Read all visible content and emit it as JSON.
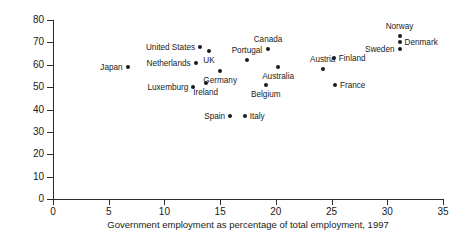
{
  "chart_data": {
    "type": "scatter",
    "title": "",
    "xlabel": "Government employment as percentage of total employment, 1997",
    "ylabel": "Women's rates of employment, 1998 (%)",
    "xlim": [
      0,
      35
    ],
    "ylim": [
      0,
      80
    ],
    "xticks": [
      "0",
      "5",
      "10",
      "15",
      "20",
      "25",
      "30",
      "35"
    ],
    "yticks": [
      "0",
      "10",
      "20",
      "30",
      "40",
      "50",
      "60",
      "70",
      "80"
    ],
    "grid": false,
    "legend": "none",
    "points": [
      {
        "label": "Japan",
        "x": 6.7,
        "y": 59,
        "label_pos": "left"
      },
      {
        "label": "Luxemburg",
        "x": 12.6,
        "y": 50,
        "label_pos": "left"
      },
      {
        "label": "Netherlands",
        "x": 12.8,
        "y": 61,
        "label_pos": "left"
      },
      {
        "label": "United States",
        "x": 13.2,
        "y": 68,
        "label_pos": "left"
      },
      {
        "label": "Ireland",
        "x": 13.7,
        "y": 52,
        "label_pos": "below"
      },
      {
        "label": "UK",
        "x": 14.0,
        "y": 66,
        "label_pos": "below"
      },
      {
        "label": "Germany",
        "x": 15.0,
        "y": 57,
        "label_pos": "below"
      },
      {
        "label": "Spain",
        "x": 15.9,
        "y": 37,
        "label_pos": "left"
      },
      {
        "label": "Italy",
        "x": 17.2,
        "y": 37,
        "label_pos": "right"
      },
      {
        "label": "Belgium",
        "x": 19.1,
        "y": 51,
        "label_pos": "below"
      },
      {
        "label": "Portugal",
        "x": 17.4,
        "y": 62,
        "label_pos": "above"
      },
      {
        "label": "Canada",
        "x": 19.3,
        "y": 67,
        "label_pos": "above"
      },
      {
        "label": "Australia",
        "x": 20.2,
        "y": 59,
        "label_pos": "below"
      },
      {
        "label": "Austria",
        "x": 24.2,
        "y": 58,
        "label_pos": "above"
      },
      {
        "label": "Finland",
        "x": 25.2,
        "y": 63,
        "label_pos": "right"
      },
      {
        "label": "France",
        "x": 25.3,
        "y": 51,
        "label_pos": "right"
      },
      {
        "label": "Norway",
        "x": 31.1,
        "y": 73,
        "label_pos": "above"
      },
      {
        "label": "Denmark",
        "x": 31.1,
        "y": 70,
        "label_pos": "right"
      },
      {
        "label": "Sweden",
        "x": 31.1,
        "y": 67,
        "label_pos": "left"
      }
    ]
  }
}
